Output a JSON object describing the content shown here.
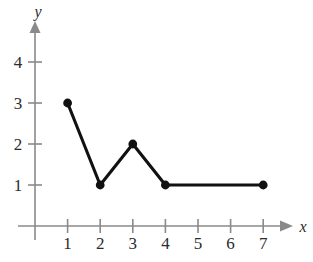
{
  "chart_data": {
    "type": "line",
    "title": "",
    "xlabel": "x",
    "ylabel": "y",
    "x": [
      1,
      2,
      3,
      4,
      7
    ],
    "values": [
      3,
      1,
      2,
      1,
      1
    ],
    "points": [
      {
        "x": 1,
        "y": 3
      },
      {
        "x": 2,
        "y": 1
      },
      {
        "x": 3,
        "y": 2
      },
      {
        "x": 4,
        "y": 1
      },
      {
        "x": 7,
        "y": 1
      }
    ],
    "xticks": [
      1,
      2,
      3,
      4,
      5,
      6,
      7
    ],
    "xtick_labels": [
      "1",
      "2",
      "3",
      "4",
      "5",
      "6",
      "7"
    ],
    "yticks": [
      1,
      2,
      3,
      4
    ],
    "ytick_labels": [
      "1",
      "2",
      "3",
      "4"
    ],
    "xlim": [
      0,
      7.8
    ],
    "ylim": [
      0,
      4.8
    ],
    "grid": false,
    "legend": false,
    "markers": "filled-circle",
    "colors": {
      "series": "#111111",
      "axis": "#8a8a8a",
      "text": "#2b2b2b",
      "background": "#ffffff"
    }
  },
  "axes": {
    "x_label": "x",
    "y_label": "y"
  },
  "xtick_labels": [
    "1",
    "2",
    "3",
    "4",
    "5",
    "6",
    "7"
  ],
  "ytick_labels": [
    "1",
    "2",
    "3",
    "4"
  ]
}
